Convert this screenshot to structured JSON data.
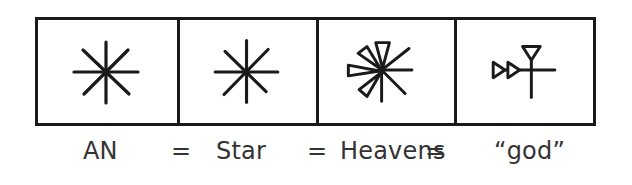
{
  "diagram": {
    "title": "",
    "cells": [
      {
        "id": "an",
        "glyph": "eight-pointed-star-icon",
        "meaning": "AN"
      },
      {
        "id": "star",
        "glyph": "eight-pointed-star-icon",
        "meaning": "Star"
      },
      {
        "id": "heavens",
        "glyph": "cuneiform-star-with-wedges-icon",
        "meaning": "Heavens"
      },
      {
        "id": "god",
        "glyph": "cuneiform-dingir-icon",
        "meaning": "“god”"
      }
    ],
    "labels": {
      "an": "AN",
      "eq1": "=",
      "star": "Star",
      "eq2": "=",
      "heavens": "Heavens",
      "eq3": "=",
      "god": "“god”"
    },
    "colors": {
      "stroke": "#1a1a1a",
      "text": "#333333",
      "background": "#ffffff"
    }
  }
}
